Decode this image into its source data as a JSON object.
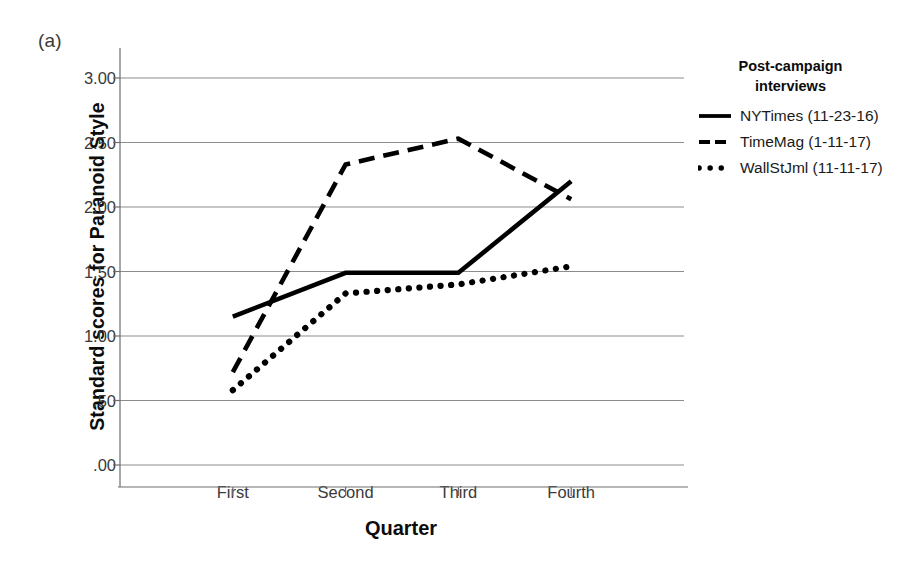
{
  "panel_label": "(a)",
  "legend": {
    "title_line1": "Post-campaign",
    "title_line2": "interviews",
    "entries": [
      {
        "label": "NYTimes (11-23-16)",
        "style": "solid"
      },
      {
        "label": "TimeMag (1-11-17)",
        "style": "dashed"
      },
      {
        "label": "WallStJml (11-11-17)",
        "style": "dotted"
      }
    ]
  },
  "chart_data": {
    "type": "line",
    "title": "",
    "xlabel": "Quarter",
    "ylabel": "Standard scores for Paranoid Style",
    "categories": [
      "First",
      "Second",
      "Third",
      "Fourth"
    ],
    "ylim": [
      0.0,
      3.0
    ],
    "yticks": [
      3.0,
      2.5,
      2.0,
      1.5,
      1.0,
      0.5,
      0.0
    ],
    "ytick_labels": [
      "3.00",
      "2.50",
      "2.00",
      "1.50",
      "1.00",
      ".50",
      ".00"
    ],
    "grid": true,
    "legend_position": "right",
    "series": [
      {
        "name": "NYTimes (11-23-16)",
        "style": "solid",
        "color": "#000000",
        "values": [
          1.15,
          1.49,
          1.49,
          2.2
        ]
      },
      {
        "name": "TimeMag (1-11-17)",
        "style": "dashed",
        "color": "#000000",
        "values": [
          0.72,
          2.33,
          2.53,
          2.06
        ]
      },
      {
        "name": "WallStJml (11-11-17)",
        "style": "dotted",
        "color": "#000000",
        "values": [
          0.58,
          1.33,
          1.4,
          1.54
        ]
      }
    ]
  }
}
